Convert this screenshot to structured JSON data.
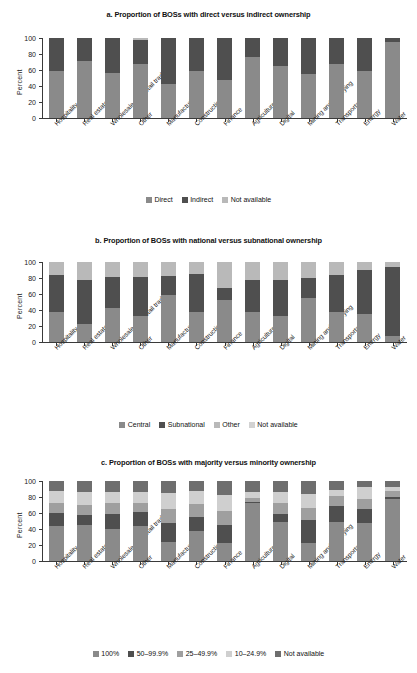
{
  "figure": {
    "width": 417,
    "height": 673,
    "background": "#ffffff"
  },
  "palette": {
    "mid_gray": "#8a8a8a",
    "dark_gray": "#4f4f4f",
    "light_gray": "#b9b9b9",
    "lighter_gray": "#d2d2d2",
    "darkest_gray": "#3f3f3f",
    "axis": "#3a3a3a",
    "text": "#1a1a1a"
  },
  "categories": [
    "Hospitality",
    "Real estate",
    "Wholesale and retail trade",
    "Other",
    "Manufacturing",
    "Construction",
    "Finance",
    "Agriculture",
    "Digital",
    "Mining and quarrying",
    "Transportation",
    "Energy",
    "Water"
  ],
  "yaxis": {
    "label": "Percent",
    "ticks": [
      100,
      80,
      60,
      40,
      20,
      0
    ],
    "min": 0,
    "max": 100
  },
  "chart_data": [
    {
      "type": "bar",
      "stacked": true,
      "panel": "a",
      "title": "a. Proportion of BOSs with direct versus indirect ownership",
      "xlabel": "",
      "ylabel": "Percent",
      "ylim": [
        0,
        100
      ],
      "grid": false,
      "legend_position": "bottom",
      "categories": [
        "Hospitality",
        "Real estate",
        "Wholesale and retail trade",
        "Other",
        "Manufacturing",
        "Construction",
        "Finance",
        "Agriculture",
        "Digital",
        "Mining and quarrying",
        "Transportation",
        "Energy",
        "Water"
      ],
      "series": [
        {
          "name": "Direct",
          "color": "#8a8a8a",
          "values": [
            59,
            71,
            56,
            67,
            42,
            59,
            47,
            76,
            65,
            55,
            67,
            59,
            95
          ]
        },
        {
          "name": "Indirect",
          "color": "#4f4f4f",
          "values": [
            41,
            29,
            44,
            31,
            58,
            41,
            53,
            24,
            35,
            45,
            33,
            41,
            5
          ]
        },
        {
          "name": "Not available",
          "color": "#b9b9b9",
          "values": [
            0,
            0,
            0,
            2,
            0,
            0,
            0,
            0,
            0,
            0,
            0,
            0,
            0
          ]
        }
      ]
    },
    {
      "type": "bar",
      "stacked": true,
      "panel": "b",
      "title": "b. Proportion of BOSs with national versus subnational ownership",
      "xlabel": "",
      "ylabel": "Percent",
      "ylim": [
        0,
        100
      ],
      "grid": false,
      "legend_position": "bottom",
      "categories": [
        "Hospitality",
        "Real estate",
        "Wholesale and retail trade",
        "Other",
        "Manufacturing",
        "Construction",
        "Finance",
        "Agriculture",
        "Digital",
        "Mining and quarrying",
        "Transportation",
        "Energy",
        "Water"
      ],
      "series": [
        {
          "name": "Central",
          "color": "#8a8a8a",
          "values": [
            38,
            22,
            42,
            33,
            59,
            37,
            52,
            37,
            33,
            55,
            38,
            35,
            7
          ]
        },
        {
          "name": "Subnational",
          "color": "#4f4f4f",
          "values": [
            46,
            55,
            39,
            48,
            23,
            48,
            16,
            41,
            44,
            25,
            46,
            55,
            87
          ]
        },
        {
          "name": "Other",
          "color": "#b9b9b9",
          "values": [
            16,
            23,
            19,
            19,
            18,
            15,
            32,
            22,
            23,
            20,
            16,
            10,
            6
          ]
        },
        {
          "name": "Not available",
          "color": "#d2d2d2",
          "values": [
            0,
            0,
            0,
            0,
            0,
            0,
            0,
            0,
            0,
            0,
            0,
            0,
            0
          ]
        }
      ]
    },
    {
      "type": "bar",
      "stacked": true,
      "panel": "c",
      "title": "c. Proportion of BOSs with majority versus minority ownership",
      "xlabel": "",
      "ylabel": "Percent",
      "ylim": [
        0,
        100
      ],
      "grid": false,
      "legend_position": "bottom",
      "categories": [
        "Hospitality",
        "Real estate",
        "Wholesale and retail trade",
        "Other",
        "Manufacturing",
        "Construction",
        "Finance",
        "Agriculture",
        "Digital",
        "Mining and quarrying",
        "Transportation",
        "Energy",
        "Water"
      ],
      "series": [
        {
          "name": "100%",
          "color": "#8a8a8a",
          "values": [
            44,
            45,
            40,
            44,
            24,
            38,
            22,
            72,
            49,
            23,
            49,
            48,
            77
          ]
        },
        {
          "name": "50–99.9%",
          "color": "#4f4f4f",
          "values": [
            16,
            13,
            19,
            17,
            23,
            17,
            23,
            2,
            10,
            28,
            20,
            17,
            3
          ]
        },
        {
          "name": "25–49.9%",
          "color": "#9f9f9f",
          "values": [
            12,
            12,
            13,
            12,
            18,
            16,
            18,
            5,
            14,
            15,
            12,
            13,
            8
          ]
        },
        {
          "name": "10–24.9%",
          "color": "#cfcfcf",
          "values": [
            16,
            16,
            14,
            13,
            20,
            17,
            19,
            7,
            13,
            18,
            8,
            15,
            4
          ]
        },
        {
          "name": "Not available",
          "color": "#6e6e6e",
          "values": [
            12,
            14,
            14,
            14,
            15,
            12,
            18,
            14,
            14,
            16,
            11,
            7,
            8
          ]
        }
      ]
    }
  ]
}
